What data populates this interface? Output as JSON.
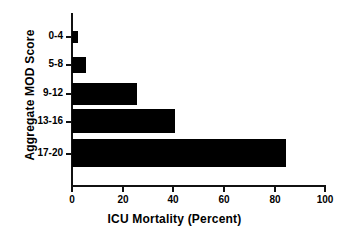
{
  "chart_data": {
    "type": "bar",
    "orientation": "horizontal",
    "title": "",
    "xlabel": "ICU Mortality (Percent)",
    "ylabel": "Aggregate MOD Score",
    "categories": [
      "0-4",
      "5-8",
      "9-12",
      "13-16",
      "17-20"
    ],
    "values": [
      2.4,
      5.5,
      25.7,
      40.7,
      84.6
    ],
    "xlim": [
      0,
      100
    ],
    "xticks": [
      0,
      20,
      40,
      60,
      80,
      100
    ],
    "xtick_labels": [
      "0",
      "20",
      "40",
      "60",
      "80",
      "100"
    ],
    "grid": false,
    "legend": null,
    "bar_color": "#000000",
    "axis_color": "#111111",
    "background_color": "#ffffff"
  }
}
